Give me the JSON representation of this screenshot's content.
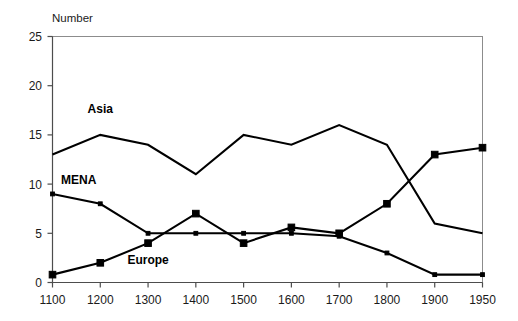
{
  "chart_data": {
    "type": "line",
    "title": "",
    "ylabel": "Number",
    "xlabel": "",
    "categories": [
      "1100",
      "1200",
      "1300",
      "1400",
      "1500",
      "1600",
      "1700",
      "1800",
      "1900",
      "1950"
    ],
    "ylim": [
      0,
      25
    ],
    "ytick_labels": [
      "0",
      "5",
      "10",
      "15",
      "20",
      "25"
    ],
    "ytick_values": [
      0,
      5,
      10,
      15,
      20,
      25
    ],
    "grid": false,
    "legend": "inline-labels",
    "series": [
      {
        "name": "Asia",
        "marker": "none",
        "color": "#000000",
        "values": [
          13,
          15,
          14,
          11,
          15,
          14,
          16,
          14,
          6,
          5
        ]
      },
      {
        "name": "MENA",
        "marker": "dot",
        "color": "#000000",
        "values": [
          9,
          8,
          5,
          5,
          5,
          5,
          4.7,
          3,
          0.8,
          0.8
        ]
      },
      {
        "name": "Europe",
        "marker": "square",
        "color": "#000000",
        "values": [
          0.8,
          2,
          4,
          7,
          4,
          5.6,
          5,
          8,
          13,
          13.7
        ]
      }
    ],
    "annotations": [
      {
        "text": "Asia",
        "x_index": 1,
        "y_value": 17.2
      },
      {
        "text": "MENA",
        "x_index": 0.55,
        "y_value": 10.0
      },
      {
        "text": "Europe",
        "x_index": 2.0,
        "y_value": 1.9
      }
    ]
  }
}
